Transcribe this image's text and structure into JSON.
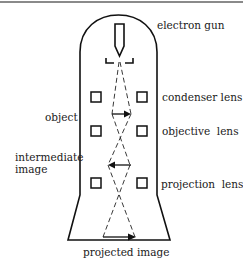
{
  "diagram": {
    "labels": {
      "electron_gun": "electron gun",
      "condenser_lens": "condenser lens",
      "object": "object",
      "objective_lens": "objective  lens",
      "intermediate_image_line1": "intermediate",
      "intermediate_image_line2": "image",
      "projection_lens": "projection  lens",
      "projected_image": "projected image"
    },
    "arrows": {
      "object": "right",
      "intermediate_image": "left",
      "projected_image": "right"
    },
    "colors": {
      "line": "#111111",
      "background": "#ffffff",
      "top_rule": "#8a8a8a"
    }
  }
}
